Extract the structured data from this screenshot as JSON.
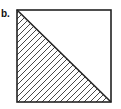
{
  "figure": {
    "label": "b.",
    "shape": "square",
    "divider": "diagonal from top-left to bottom-right",
    "hatched_region": "lower-left triangle",
    "stroke_color": "#222222",
    "fill_color": "#ffffff"
  }
}
